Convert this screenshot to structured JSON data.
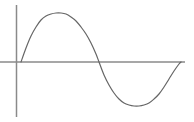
{
  "figure": {
    "title": "",
    "width": 194,
    "height": 122,
    "background_color": "#ffffff"
  },
  "axes": {
    "vertical_axis": {
      "name": "y-axis",
      "x": 16.5,
      "y_top": 5,
      "y_bottom": 117,
      "color": "#8a8a8a",
      "width": 1.5
    },
    "horizontal_axis": {
      "name": "x-axis",
      "y": 62,
      "x_left": 0,
      "x_right": 185,
      "color": "#8a8a8a",
      "width": 1.5
    }
  },
  "chart_data": {
    "type": "line",
    "title": "",
    "subtitle": "",
    "xlabel": "",
    "ylabel": "",
    "grid": false,
    "legend": null,
    "axis_color": "#8a8a8a",
    "series": [
      {
        "name": "sine wave",
        "color": "#666666",
        "line_width": 1.2,
        "description": "one full sine cycle: rises from baseline to a positive crest, returns to baseline, falls to a negative trough, returns to baseline",
        "x": [
          21,
          26,
          31,
          36,
          41,
          46,
          51,
          56,
          61,
          66,
          71,
          76,
          81,
          86,
          91,
          96,
          99,
          104,
          109,
          114,
          119,
          124,
          129,
          134,
          139,
          144,
          149,
          154,
          159,
          164,
          169,
          174,
          179,
          181
        ],
        "y_pixel": [
          62,
          48,
          36,
          27,
          20,
          16,
          14,
          13,
          13,
          14,
          17,
          21,
          27,
          34,
          43,
          54,
          62,
          75,
          85,
          93,
          99,
          103,
          105,
          106,
          106,
          105,
          103,
          99,
          94,
          87,
          79,
          71,
          64,
          62
        ],
        "y": [
          0.0,
          0.29,
          0.53,
          0.71,
          0.86,
          0.94,
          0.98,
          1.0,
          1.0,
          0.98,
          0.92,
          0.84,
          0.71,
          0.57,
          0.39,
          0.16,
          0.0,
          -0.27,
          -0.47,
          -0.63,
          -0.76,
          -0.84,
          -0.88,
          -0.9,
          -0.9,
          -0.88,
          -0.84,
          -0.76,
          -0.65,
          -0.51,
          -0.35,
          -0.18,
          -0.04,
          0.0
        ]
      }
    ],
    "xlim": [
      16.5,
      185
    ],
    "ylim": [
      -1.05,
      1.05
    ],
    "baseline_y_pixel": 62,
    "key_points": {
      "start": {
        "x": 21,
        "y": 62
      },
      "crest": {
        "x": 62,
        "y": 13
      },
      "zero_crossing": {
        "x": 99,
        "y": 62
      },
      "trough": {
        "x": 141,
        "y": 106
      },
      "end": {
        "x": 181,
        "y": 62
      }
    }
  }
}
